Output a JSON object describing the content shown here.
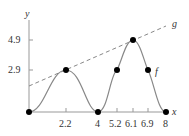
{
  "figure": {
    "axis_labels": {
      "x": "x",
      "y": "y"
    },
    "y_ticks": [
      {
        "value": 4.9,
        "label": "4.9"
      },
      {
        "value": 2.9,
        "label": "2.9"
      }
    ],
    "x_ticks": [
      {
        "value": 2.2,
        "label": "2.2"
      },
      {
        "value": 4,
        "label": "4"
      },
      {
        "value": 5.2,
        "label": "5.2"
      },
      {
        "value": 6.1,
        "label": "6.1"
      },
      {
        "value": 6.9,
        "label": "6.9"
      },
      {
        "value": 8,
        "label": "8"
      }
    ],
    "curves": {
      "f": {
        "label": "f",
        "style": "solid",
        "color": "#888888"
      },
      "g": {
        "label": "g",
        "style": "dashed",
        "color": "#888888"
      }
    },
    "points": [
      {
        "x": 0,
        "y": 0
      },
      {
        "x": 2.2,
        "y": 2.9
      },
      {
        "x": 4,
        "y": 0
      },
      {
        "x": 5.2,
        "y": 2.9
      },
      {
        "x": 6.1,
        "y": 4.9
      },
      {
        "x": 6.9,
        "y": 2.9
      },
      {
        "x": 8,
        "y": 0
      }
    ]
  }
}
